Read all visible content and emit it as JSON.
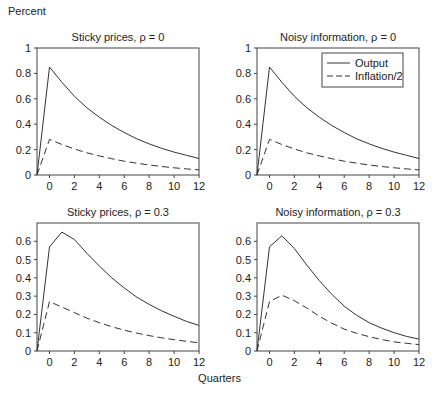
{
  "figure": {
    "ylabel": "Percent",
    "xlabel": "Quarters"
  },
  "legend": {
    "entries": [
      {
        "label": "Output",
        "style": "solid"
      },
      {
        "label": "Inflation/2",
        "style": "dashed"
      }
    ]
  },
  "chart_data": [
    {
      "type": "line",
      "title": "Sticky prices, ρ = 0",
      "xlabel": "Quarters",
      "ylabel": "Percent",
      "x": [
        -1,
        0,
        1,
        2,
        3,
        4,
        5,
        6,
        7,
        8,
        9,
        10,
        11,
        12
      ],
      "xticks": [
        0,
        2,
        4,
        6,
        8,
        10,
        12
      ],
      "xlim": [
        -1,
        12
      ],
      "ylim": [
        0,
        1
      ],
      "yticks": [
        0,
        0.2,
        0.4,
        0.6,
        0.8,
        1
      ],
      "grid": false,
      "series": [
        {
          "name": "Output",
          "style": "solid",
          "values": [
            0,
            0.85,
            0.73,
            0.62,
            0.53,
            0.455,
            0.39,
            0.335,
            0.285,
            0.245,
            0.21,
            0.18,
            0.155,
            0.13
          ]
        },
        {
          "name": "Inflation/2",
          "style": "dashed",
          "values": [
            0,
            0.28,
            0.24,
            0.205,
            0.175,
            0.15,
            0.128,
            0.109,
            0.093,
            0.079,
            0.067,
            0.057,
            0.048,
            0.04
          ]
        }
      ]
    },
    {
      "type": "line",
      "title": "Noisy information, ρ = 0",
      "xlabel": "Quarters",
      "ylabel": "Percent",
      "x": [
        -1,
        0,
        1,
        2,
        3,
        4,
        5,
        6,
        7,
        8,
        9,
        10,
        11,
        12
      ],
      "xticks": [
        0,
        2,
        4,
        6,
        8,
        10,
        12
      ],
      "xlim": [
        -1,
        12
      ],
      "ylim": [
        0,
        1
      ],
      "yticks": [
        0,
        0.2,
        0.4,
        0.6,
        0.8,
        1
      ],
      "grid": false,
      "legend_position": "upper right",
      "series": [
        {
          "name": "Output",
          "style": "solid",
          "values": [
            0,
            0.85,
            0.73,
            0.62,
            0.53,
            0.455,
            0.39,
            0.335,
            0.285,
            0.245,
            0.21,
            0.18,
            0.155,
            0.13
          ]
        },
        {
          "name": "Inflation/2",
          "style": "dashed",
          "values": [
            0,
            0.28,
            0.24,
            0.205,
            0.175,
            0.15,
            0.128,
            0.109,
            0.093,
            0.079,
            0.067,
            0.057,
            0.048,
            0.04
          ]
        }
      ]
    },
    {
      "type": "line",
      "title": "Sticky prices, ρ = 0.3",
      "xlabel": "Quarters",
      "ylabel": "Percent",
      "x": [
        -1,
        0,
        1,
        2,
        3,
        4,
        5,
        6,
        7,
        8,
        9,
        10,
        11,
        12
      ],
      "xticks": [
        0,
        2,
        4,
        6,
        8,
        10,
        12
      ],
      "xlim": [
        -1,
        12
      ],
      "ylim": [
        0,
        0.7
      ],
      "yticks": [
        0,
        0.1,
        0.2,
        0.3,
        0.4,
        0.5,
        0.6
      ],
      "grid": false,
      "series": [
        {
          "name": "Output",
          "style": "solid",
          "values": [
            0,
            0.57,
            0.65,
            0.61,
            0.535,
            0.465,
            0.4,
            0.345,
            0.295,
            0.255,
            0.22,
            0.19,
            0.162,
            0.14
          ]
        },
        {
          "name": "Inflation/2",
          "style": "dashed",
          "values": [
            0,
            0.27,
            0.24,
            0.21,
            0.18,
            0.155,
            0.133,
            0.114,
            0.098,
            0.084,
            0.072,
            0.062,
            0.053,
            0.045
          ]
        }
      ]
    },
    {
      "type": "line",
      "title": "Noisy information, ρ = 0.3",
      "xlabel": "Quarters",
      "ylabel": "Percent",
      "x": [
        -1,
        0,
        1,
        2,
        3,
        4,
        5,
        6,
        7,
        8,
        9,
        10,
        11,
        12
      ],
      "xticks": [
        0,
        2,
        4,
        6,
        8,
        10,
        12
      ],
      "xlim": [
        -1,
        12
      ],
      "ylim": [
        0,
        0.7
      ],
      "yticks": [
        0,
        0.1,
        0.2,
        0.3,
        0.4,
        0.5,
        0.6
      ],
      "grid": false,
      "series": [
        {
          "name": "Output",
          "style": "solid",
          "values": [
            0,
            0.57,
            0.63,
            0.56,
            0.47,
            0.385,
            0.31,
            0.245,
            0.195,
            0.155,
            0.125,
            0.1,
            0.08,
            0.065
          ]
        },
        {
          "name": "Inflation/2",
          "style": "dashed",
          "values": [
            0,
            0.27,
            0.305,
            0.275,
            0.235,
            0.19,
            0.152,
            0.12,
            0.097,
            0.078,
            0.063,
            0.05,
            0.042,
            0.035
          ]
        }
      ]
    }
  ]
}
